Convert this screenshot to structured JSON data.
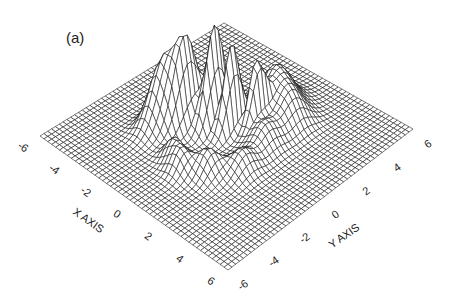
{
  "figure": {
    "panel_label": "(a)"
  },
  "chart_data": {
    "type": "surface3d",
    "title": "",
    "panel_label": "(a)",
    "xlabel": "X AXIS",
    "ylabel": "Y AXIS",
    "zlabel": "",
    "x_ticks": [
      "-6",
      "-4",
      "-2",
      "0",
      "2",
      "4",
      "6"
    ],
    "y_ticks": [
      "-6",
      "-4",
      "-2",
      "0",
      "2",
      "4",
      "6"
    ],
    "xlim": [
      -6,
      6
    ],
    "ylim": [
      -6,
      6
    ],
    "grid_resolution": 49,
    "render_style": "black wireframe mesh with hidden-line removal, white background",
    "view": {
      "corner_pixels": {
        "x-6_y-6": [
          40,
          136
        ],
        "x6_y-6": [
          228,
          270
        ],
        "x6_y6": [
          413,
          129
        ],
        "x-6_y6": [
          224,
          23
        ]
      },
      "z_pixel_scale": 95
    },
    "peaks": [
      {
        "x": -1.0,
        "y": 0.2,
        "amplitude": 1.0,
        "sx": 0.25,
        "sy": 0.55,
        "note": "tallest narrow spike"
      },
      {
        "x": -0.2,
        "y": 0.6,
        "amplitude": 0.92,
        "sx": 0.22,
        "sy": 0.5
      },
      {
        "x": -2.0,
        "y": -0.6,
        "amplitude": 0.85,
        "sx": 0.35,
        "sy": 0.7
      },
      {
        "x": -2.8,
        "y": -1.2,
        "amplitude": 0.7,
        "sx": 0.45,
        "sy": 0.8
      },
      {
        "x": 0.6,
        "y": 1.4,
        "amplitude": 0.7,
        "sx": 0.2,
        "sy": 0.45
      },
      {
        "x": -1.5,
        "y": 1.0,
        "amplitude": 0.55,
        "sx": 0.35,
        "sy": 0.5
      },
      {
        "x": 0.2,
        "y": 3.0,
        "amplitude": 0.45,
        "sx": 0.7,
        "sy": 0.8,
        "note": "broad hump toward +Y"
      },
      {
        "x": 1.5,
        "y": 2.6,
        "amplitude": 0.3,
        "sx": 0.6,
        "sy": 0.7
      },
      {
        "x": 1.0,
        "y": -2.2,
        "amplitude": 0.25,
        "sx": 0.5,
        "sy": 0.5
      },
      {
        "x": 0.0,
        "y": -3.0,
        "amplitude": 0.22,
        "sx": 0.45,
        "sy": 0.45
      },
      {
        "x": 2.0,
        "y": -1.0,
        "amplitude": 0.22,
        "sx": 0.5,
        "sy": 0.6
      },
      {
        "x": 1.6,
        "y": 0.8,
        "amplitude": 0.25,
        "sx": 0.6,
        "sy": 0.6
      },
      {
        "x": -0.8,
        "y": -2.6,
        "amplitude": 0.2,
        "sx": 0.4,
        "sy": 0.4
      }
    ],
    "base_level": 0,
    "legend": null
  }
}
